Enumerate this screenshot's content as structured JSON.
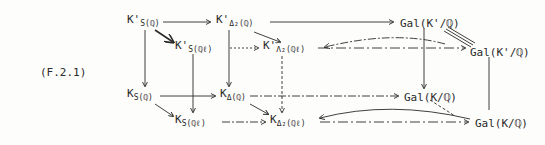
{
  "equation_label": "(F.2.1)",
  "nodes": {
    "k_prime_s_q": {
      "base": "K'",
      "sub": "S(ℚ)"
    },
    "k_prime_delta2_q": {
      "base": "K'",
      "sub": "Δ₂(ℚ)"
    },
    "gal_kprime_q_top": {
      "text": "Gal(K'/ℚ)"
    },
    "k_prime_s_ql": {
      "base": "K'",
      "sub": "S(ℚℓ)"
    },
    "k_prime_lambda2_ql": {
      "base": "K'",
      "sub": "Λ₂(ℚℓ)"
    },
    "gal_kprime_q_right": {
      "text": "Gal(K'/ℚ)"
    },
    "k_s_q": {
      "base": "K",
      "sub": "S(ℚ)"
    },
    "k_delta_q": {
      "base": "K",
      "sub": "Δ(ℚ)"
    },
    "gal_k_q_mid": {
      "text": "Gal(K/ℚ)"
    },
    "k_s_ql": {
      "base": "K",
      "sub": "S(ℚℓ)"
    },
    "k_delta2_ql": {
      "base": "K",
      "sub": "Δ₂(ℚℓ)"
    },
    "gal_k_q_right": {
      "text": "Gal(K/ℚ)"
    }
  }
}
